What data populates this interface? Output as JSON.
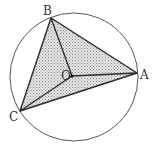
{
  "diagram": {
    "type": "geometry",
    "circle": {
      "center_label": "O",
      "cx": 74,
      "cy": 77,
      "r": 64
    },
    "points": {
      "A": {
        "label": "A",
        "x": 137,
        "y": 73
      },
      "B": {
        "label": "B",
        "x": 51,
        "y": 18
      },
      "C": {
        "label": "C",
        "x": 20,
        "y": 111
      },
      "O": {
        "label": "O",
        "x": 72,
        "y": 76
      }
    },
    "segments": [
      "AB",
      "BC",
      "CA",
      "OA",
      "OB",
      "OC"
    ],
    "colors": {
      "stroke": "#2a2a2a",
      "circle": "#555555",
      "fill": "#c8c8c8"
    }
  }
}
